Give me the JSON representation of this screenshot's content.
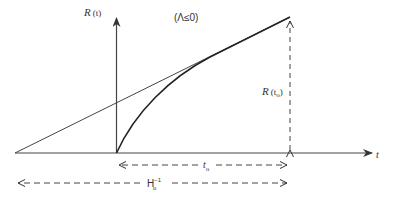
{
  "diagram": {
    "type": "cosmology scale factor vs time",
    "condition_label": "(Λ≤0)",
    "y_axis": {
      "label_main": "R",
      "label_arg": "(t)"
    },
    "x_axis": {
      "label": "t"
    },
    "vertical_marker": {
      "label_main": "R",
      "label_arg": "(t",
      "label_sub": "o",
      "label_close": ")"
    },
    "t0_span": {
      "label_main": "t",
      "label_sub": "o"
    },
    "hubble_span": {
      "label_main": "H",
      "label_sub": "o",
      "label_sup": "−1"
    },
    "curves": [
      {
        "name": "tangent-line",
        "description": "straight line extrapolation from H0^-1 origin to present"
      },
      {
        "name": "scale-factor-curve",
        "description": "decelerating R(t) curve from t=0 to t0"
      }
    ],
    "colors": {
      "ink": "#333333",
      "background": "#ffffff"
    }
  }
}
